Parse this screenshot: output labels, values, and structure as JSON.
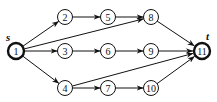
{
  "diagram": {
    "type": "directed-graph",
    "colors": {
      "stroke": "#111111",
      "background": "#ffffff"
    },
    "labels": {
      "source": "s",
      "sink": "t"
    },
    "nodes": [
      {
        "id": "1",
        "label": "1",
        "x": 16,
        "y": 51,
        "bold": true
      },
      {
        "id": "2",
        "label": "2",
        "x": 65,
        "y": 17,
        "bold": false
      },
      {
        "id": "3",
        "label": "3",
        "x": 65,
        "y": 51,
        "bold": false
      },
      {
        "id": "4",
        "label": "4",
        "x": 65,
        "y": 88,
        "bold": false
      },
      {
        "id": "5",
        "label": "5",
        "x": 108,
        "y": 17,
        "bold": false
      },
      {
        "id": "6",
        "label": "6",
        "x": 108,
        "y": 51,
        "bold": false
      },
      {
        "id": "7",
        "label": "7",
        "x": 108,
        "y": 88,
        "bold": false
      },
      {
        "id": "8",
        "label": "8",
        "x": 151,
        "y": 17,
        "bold": false
      },
      {
        "id": "9",
        "label": "9",
        "x": 151,
        "y": 51,
        "bold": false
      },
      {
        "id": "10",
        "label": "10",
        "x": 151,
        "y": 88,
        "bold": false
      },
      {
        "id": "11",
        "label": "11",
        "x": 202,
        "y": 51,
        "bold": true
      }
    ],
    "edges": [
      {
        "from": "1",
        "to": "2"
      },
      {
        "from": "1",
        "to": "3"
      },
      {
        "from": "1",
        "to": "4"
      },
      {
        "from": "1",
        "to": "8"
      },
      {
        "from": "2",
        "to": "5"
      },
      {
        "from": "5",
        "to": "8"
      },
      {
        "from": "3",
        "to": "6"
      },
      {
        "from": "6",
        "to": "9"
      },
      {
        "from": "4",
        "to": "7"
      },
      {
        "from": "7",
        "to": "10"
      },
      {
        "from": "4",
        "to": "11"
      },
      {
        "from": "8",
        "to": "11"
      },
      {
        "from": "9",
        "to": "11"
      },
      {
        "from": "10",
        "to": "11"
      }
    ]
  }
}
